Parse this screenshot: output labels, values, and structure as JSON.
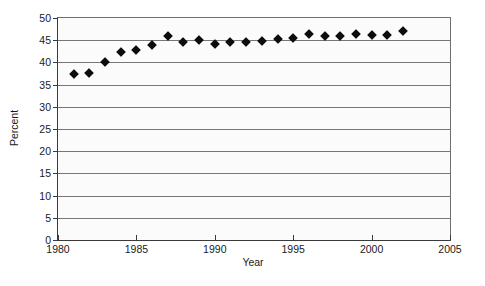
{
  "chart_data": {
    "type": "scatter",
    "title": "",
    "subtitle": "",
    "xlabel": "Year",
    "ylabel": "Percent",
    "xlim": [
      1980,
      2005
    ],
    "ylim": [
      0,
      50
    ],
    "xticks": [
      1980,
      1985,
      1990,
      1995,
      2000,
      2005
    ],
    "yticks": [
      0,
      5,
      10,
      15,
      20,
      25,
      30,
      35,
      40,
      45,
      50
    ],
    "xtick_labels": [
      "1980",
      "1985",
      "1990",
      "1995",
      "2000",
      "2005"
    ],
    "ytick_labels": [
      "0",
      "5",
      "10",
      "15",
      "20",
      "25",
      "30",
      "35",
      "40",
      "45",
      "50"
    ],
    "grid": "horizontal",
    "legend": "none",
    "legend_position": "none",
    "marker": "diamond",
    "marker_color": "#0d0d0d",
    "gridline_color": "#777777",
    "axis_color": "#3a3a3a",
    "plot_background": "#fbfbfb",
    "figure_background": "#ffffff",
    "annotations": [],
    "x": [
      1981,
      1982,
      1983,
      1984,
      1985,
      1986,
      1987,
      1988,
      1989,
      1990,
      1991,
      1992,
      1993,
      1994,
      1995,
      1996,
      1997,
      1998,
      1999,
      2000,
      2001,
      2002
    ],
    "values": [
      37.3,
      37.7,
      40.2,
      42.3,
      42.8,
      44.0,
      46.0,
      44.5,
      45.0,
      44.1,
      44.7,
      44.5,
      44.8,
      45.3,
      45.5,
      46.5,
      46.0,
      45.9,
      46.5,
      46.2,
      46.2,
      47.0
    ],
    "series": [
      {
        "name": "Percent",
        "values": [
          37.3,
          37.7,
          40.2,
          42.3,
          42.8,
          44.0,
          46.0,
          44.5,
          45.0,
          44.1,
          44.7,
          44.5,
          44.8,
          45.3,
          45.5,
          46.5,
          46.0,
          45.9,
          46.5,
          46.2,
          46.2,
          47.0
        ]
      }
    ]
  }
}
